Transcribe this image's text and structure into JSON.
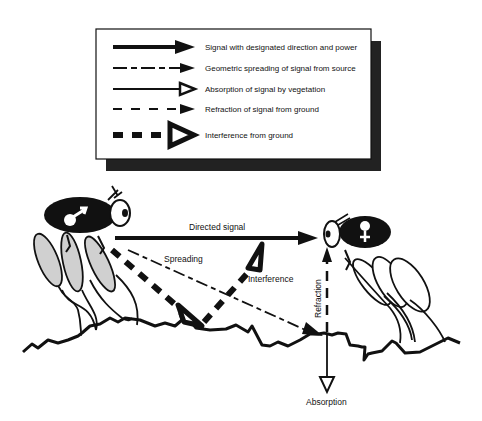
{
  "legend": {
    "items": [
      {
        "style": "thick-solid-filled-head",
        "label": "Signal with designated direction and power"
      },
      {
        "style": "dash-dot-filled-head",
        "label": "Geometric spreading of signal from source"
      },
      {
        "style": "solid-open-head",
        "label": "Absorption of signal by vegetation"
      },
      {
        "style": "dashed-filled-head",
        "label": "Refraction of signal from ground"
      },
      {
        "style": "thick-dashed-open-head",
        "label": "Interference from ground"
      }
    ]
  },
  "scene": {
    "directed_signal": "Directed signal",
    "spreading": "Spreading",
    "interference": "Interference",
    "refraction": "Refraction",
    "absorption": "Absorption",
    "sender_symbol": "♂",
    "receiver_symbol": "♀"
  }
}
